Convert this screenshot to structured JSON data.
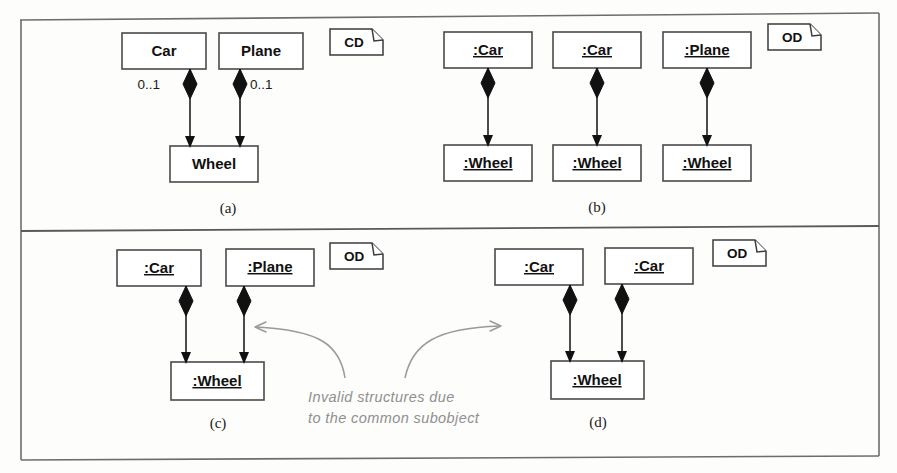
{
  "figure": {
    "background_color": "#fdfdfc",
    "line_color": "#111111",
    "frame_color": "#6d6d6d",
    "annotation_color": "#8f8f8f"
  },
  "panels": [
    {
      "id": "a",
      "caption": "(a)",
      "note_tag": "CD",
      "note_tag_meaning": "class-diagram",
      "classes": [
        "Car",
        "Plane",
        "Wheel"
      ],
      "multiplicities": [
        "0..1",
        "0..1"
      ],
      "relationship": "composition"
    },
    {
      "id": "b",
      "caption": "(b)",
      "note_tag": "OD",
      "note_tag_meaning": "object-diagram",
      "objects": [
        ":Car",
        ":Car",
        ":Plane",
        ":Wheel",
        ":Wheel",
        ":Wheel"
      ],
      "relationship": "composition"
    },
    {
      "id": "c",
      "caption": "(c)",
      "note_tag": "OD",
      "note_tag_meaning": "object-diagram",
      "objects": [
        ":Car",
        ":Plane",
        ":Wheel"
      ],
      "relationship": "composition"
    },
    {
      "id": "d",
      "caption": "(d)",
      "note_tag": "OD",
      "note_tag_meaning": "object-diagram",
      "objects": [
        ":Car",
        ":Car",
        ":Wheel"
      ],
      "relationship": "composition"
    }
  ],
  "panel_a": {
    "note_tag": "CD",
    "caption": "(a)",
    "box_car": "Car",
    "box_plane": "Plane",
    "box_wheel": "Wheel",
    "mult_left": "0..1",
    "mult_right": "0..1"
  },
  "panel_b": {
    "note_tag": "OD",
    "caption": "(b)",
    "box_car_1": ":Car",
    "box_car_2": ":Car",
    "box_plane": ":Plane",
    "box_wheel_1": ":Wheel",
    "box_wheel_2": ":Wheel",
    "box_wheel_3": ":Wheel"
  },
  "panel_c": {
    "note_tag": "OD",
    "caption": "(c)",
    "box_car": ":Car",
    "box_plane": ":Plane",
    "box_wheel": ":Wheel"
  },
  "panel_d": {
    "note_tag": "OD",
    "caption": "(d)",
    "box_car_1": ":Car",
    "box_car_2": ":Car",
    "box_wheel": ":Wheel"
  },
  "annotation": {
    "line1": "Invalid structures due",
    "line2": "to the common subobject"
  }
}
